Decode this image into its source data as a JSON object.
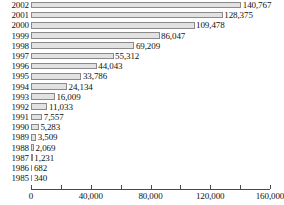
{
  "chart_data": {
    "type": "bar",
    "orientation": "horizontal",
    "title": "",
    "subtitle": "",
    "xlabel": "",
    "ylabel": "",
    "xlim": [
      0,
      160000
    ],
    "grid": false,
    "legend": null,
    "categories": [
      "2002",
      "2001",
      "2000",
      "1999",
      "1998",
      "1997",
      "1996",
      "1995",
      "1994",
      "1993",
      "1992",
      "1991",
      "1990",
      "1989",
      "1988",
      "1987",
      "1986",
      "1985"
    ],
    "values": [
      140767,
      128375,
      109478,
      86047,
      69209,
      55312,
      44043,
      33786,
      24134,
      16009,
      11033,
      7557,
      5283,
      3509,
      2069,
      1231,
      682,
      340
    ],
    "value_labels": [
      "140,767",
      "128,375",
      "109,478",
      "86,047",
      "69,209",
      "55,312",
      "44,043",
      "33,786",
      "24,134",
      "16,009",
      "11,033",
      "7,557",
      "5,283",
      "3,509",
      "2,069",
      "1,231",
      "682",
      "340"
    ],
    "xticks": [
      0,
      20000,
      40000,
      60000,
      80000,
      100000,
      120000,
      140000,
      160000
    ],
    "xtick_labels": [
      "0",
      "",
      "40,000",
      "",
      "80,000",
      "",
      "120,000",
      "",
      "160,000"
    ],
    "bar_fill_color": "#e2e2e2",
    "bar_border_color": "#8a8a8a",
    "axis_color": "#4a4a4a",
    "background_color": "#ffffff"
  }
}
